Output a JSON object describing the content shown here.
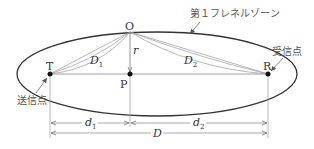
{
  "diagram": {
    "title_label": "第１フレネルゾーン",
    "transmitter_label": "送信点",
    "receiver_label": "受信点",
    "points": {
      "T": "T",
      "R": "R",
      "O": "O",
      "P": "P"
    },
    "segments": {
      "D1": "D",
      "D1_sub": "1",
      "D2": "D",
      "D2_sub": "2",
      "r": "r"
    },
    "dimensions": {
      "d1": "d",
      "d1_sub": "1",
      "d2": "d",
      "d2_sub": "2",
      "D": "D"
    },
    "colors": {
      "ellipse": "#333333",
      "lines": "#777777",
      "text": "#333333"
    }
  }
}
